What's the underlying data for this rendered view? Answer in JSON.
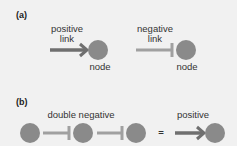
{
  "panel_a": {
    "label": "(a)",
    "positive": {
      "label_line1": "positive",
      "label_line2": "link",
      "node_label": "node"
    },
    "negative": {
      "label_line1": "negative",
      "label_line2": "link",
      "node_label": "node"
    }
  },
  "panel_b": {
    "label": "(b)",
    "double_negative_label": "double negative",
    "equals": "=",
    "positive_label": "positive"
  },
  "colors": {
    "background": "#f1f1f1",
    "node": "#8a8a8a",
    "positive_link": "#6f6f6f",
    "negative_link": "#a0a0a0"
  }
}
